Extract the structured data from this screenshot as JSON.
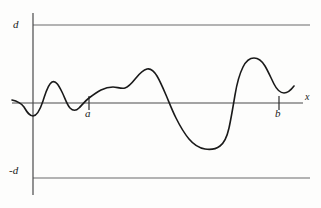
{
  "figure": {
    "type": "function-graph"
  },
  "labels": {
    "upper_bound": "d",
    "lower_bound": "-d",
    "point_a": "a",
    "point_b": "b",
    "x_axis": "x"
  },
  "colors": {
    "curve": "#1a1a1a",
    "axis": "#555555",
    "bound_line": "#6b6b6b",
    "background": "#fdfdfc",
    "text": "#1a1a1a"
  },
  "chart_data": {
    "type": "line",
    "title": "",
    "xlabel": "x",
    "ylabel": "",
    "grid": false,
    "legend": null,
    "axis_lines": {
      "x_axis_y": 0,
      "y_axis_x": 0
    },
    "horizontal_reference_lines": [
      {
        "label": "d",
        "value": 1.0
      },
      {
        "label": "-d",
        "value": -1.0
      }
    ],
    "x_ticks": [
      {
        "label": "a",
        "value": 0.72
      },
      {
        "label": "b",
        "value": 3.18
      }
    ],
    "xlim": [
      -0.25,
      3.75
    ],
    "ylim": [
      -1.15,
      1.15
    ],
    "series": [
      {
        "name": "f(x)",
        "x": [
          -0.22,
          -0.05,
          0.02,
          0.1,
          0.22,
          0.38,
          0.52,
          0.66,
          0.78,
          0.92,
          1.06,
          1.2,
          1.34,
          1.48,
          1.62,
          1.78,
          1.92,
          2.06,
          2.2,
          2.36,
          2.52,
          2.66,
          2.78,
          2.88,
          2.98,
          3.08,
          3.22,
          3.38,
          3.54,
          3.66,
          3.74
        ],
        "y": [
          0.06,
          -0.02,
          -0.13,
          -0.14,
          0.1,
          0.27,
          0.17,
          -0.06,
          -0.11,
          0.04,
          0.17,
          0.19,
          0.16,
          0.28,
          0.4,
          0.34,
          0.14,
          -0.12,
          -0.38,
          -0.57,
          -0.64,
          -0.6,
          -0.4,
          0.02,
          0.44,
          0.64,
          0.71,
          0.58,
          0.35,
          0.26,
          0.32
        ]
      }
    ]
  },
  "pixel_geometry": {
    "y_axis_x": 33,
    "x_axis_y": 103,
    "top_line_y": 25,
    "bottom_line_y": 178,
    "axis_right_x": 303,
    "tick_a_x": 89,
    "tick_b_x": 279,
    "curve_path": "M 12,100 C 17,101 21,103 24,107 C 27,112 29,116 33,116 C 37,116 40,110 43,101 C 46,92 48,84 52,82 C 56,80 59,86 62,92 C 65,98 67,105 70,108 C 73,111 76,111 79,108 C 82,105 85,101 89,98 C 93,95 97,92 101,90 C 105,88 109,87 113,87 C 117,87 121,89 125,88 C 129,87 132,83 136,78 C 140,73 143,70 147,69 C 151,68 154,71 157,76 C 160,81 163,88 166,95 C 169,102 172,110 176,118 C 180,126 184,133 189,139 C 194,145 199,148 205,149 C 211,150 216,149 220,146 C 224,143 227,137 229,128 C 231,119 233,107 235,95 C 237,83 240,73 243,67 C 246,61 250,58 254,58 C 258,58 262,61 265,66 C 268,71 271,78 274,84 C 277,90 280,93 284,93 C 288,93 291,90 294,86"
  }
}
